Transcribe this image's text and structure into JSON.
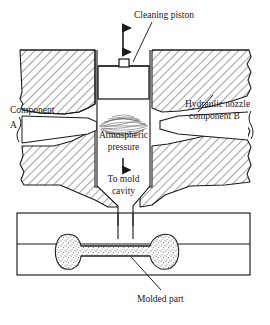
{
  "figure": {
    "background": "#ffffff",
    "line_color": "#1a1a1a",
    "hatch_color": "#2b2b2b",
    "stipple_color": "#6e6e6e"
  },
  "labels": {
    "cleaning_piston": "Cleaning piston",
    "component_a_line1": "Component",
    "component_a_line2": "A",
    "hydraulic_nozzle_line1": "Hydraulic nozzle",
    "hydraulic_nozzle_line2": "component B",
    "atmospheric_line1": "Atmospheric",
    "atmospheric_line2": "pressure",
    "to_mold_line1": "To mold",
    "to_mold_line2": "cavity",
    "molded_part": "Molded part"
  },
  "icons": {
    "piston_stroke_arrow": "double-headed-vertical-arrow",
    "flow_arrow": "down-arrow",
    "leader_cleaning_piston": "leader-line",
    "leader_molded_part": "leader-line"
  },
  "parts": {
    "piston": "cleaning-piston-block",
    "mixing_chamber": "mixing-chamber",
    "turbulence": "impingement-mixing-zone",
    "sprue": "sprue-channel",
    "mold_block": "mold-block",
    "parting_line": "mold-parting-line",
    "molded_part_shape": "dogbone-tensile-specimen"
  }
}
